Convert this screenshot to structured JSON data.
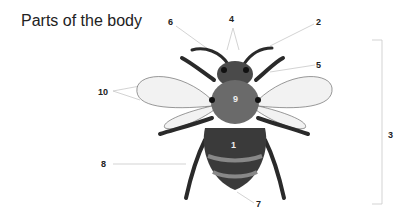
{
  "title": "Parts of the body",
  "labels": {
    "l1": "1",
    "l2": "2",
    "l3": "3",
    "l4": "4",
    "l5": "5",
    "l6": "6",
    "l7": "7",
    "l8": "8",
    "l9": "9",
    "l10": "10"
  },
  "colors": {
    "leader_line": "#c8c8c8",
    "body_dark": "#2a2a2a",
    "body_mid": "#6a6a6a",
    "wing": "#f2f2f2"
  }
}
